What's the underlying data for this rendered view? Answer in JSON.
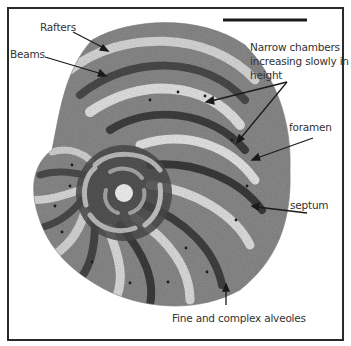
{
  "figure": {
    "scale_bar": {
      "present": true,
      "label": ""
    },
    "colors": {
      "frame": "#2a2a2a",
      "shell_dark": "#3a3a3a",
      "shell_mid": "#6b6b6b",
      "shell_light": "#e6e6e6",
      "text": "#333333",
      "arrow": "#1a1a1a"
    }
  },
  "annotations": [
    {
      "id": "rafters",
      "text": "Rafters"
    },
    {
      "id": "beams",
      "text": "Beams"
    },
    {
      "id": "narrow-chambers",
      "text": "Narrow chambers increasing slowly in height"
    },
    {
      "id": "foramen",
      "text": "foramen"
    },
    {
      "id": "septum",
      "text": "septum"
    },
    {
      "id": "alveoles",
      "text": "Fine and complex alveoles"
    }
  ]
}
